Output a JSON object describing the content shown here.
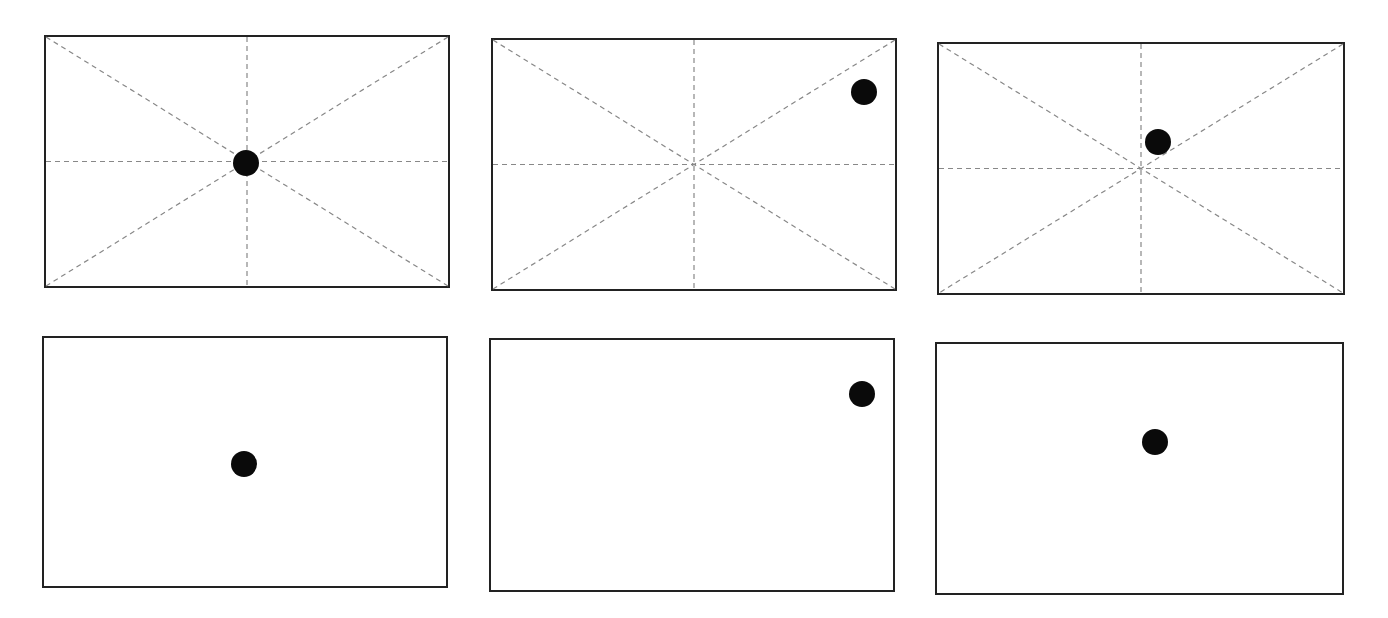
{
  "diagram": {
    "title": "",
    "colors": {
      "frame": "#222222",
      "guide": "#888888",
      "dot": "#0a0a0a",
      "background": "#ffffff"
    },
    "panels": [
      {
        "id": "top-left",
        "x": 44,
        "y": 35,
        "w": 406,
        "h": 253,
        "guides": true,
        "dot": {
          "cx": 0.497,
          "cy": 0.506,
          "d": 26
        }
      },
      {
        "id": "top-middle",
        "x": 491,
        "y": 38,
        "w": 406,
        "h": 253,
        "guides": true,
        "dot": {
          "cx": 0.923,
          "cy": 0.208,
          "d": 26
        }
      },
      {
        "id": "top-right",
        "x": 937,
        "y": 42,
        "w": 408,
        "h": 253,
        "guides": true,
        "dot": {
          "cx": 0.541,
          "cy": 0.395,
          "d": 26
        }
      },
      {
        "id": "bottom-left",
        "x": 42,
        "y": 336,
        "w": 406,
        "h": 252,
        "guides": false,
        "dot": {
          "cx": 0.498,
          "cy": 0.509,
          "d": 26
        }
      },
      {
        "id": "bottom-middle",
        "x": 489,
        "y": 338,
        "w": 406,
        "h": 254,
        "guides": false,
        "dot": {
          "cx": 0.923,
          "cy": 0.217,
          "d": 26
        }
      },
      {
        "id": "bottom-right",
        "x": 935,
        "y": 342,
        "w": 409,
        "h": 253,
        "guides": false,
        "dot": {
          "cx": 0.539,
          "cy": 0.395,
          "d": 26
        }
      }
    ]
  }
}
